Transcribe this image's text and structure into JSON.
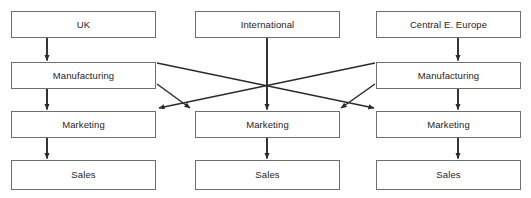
{
  "diagram": {
    "type": "organizational-flow-diagram",
    "orientation": "top-to-bottom",
    "canvas": {
      "width": 531,
      "height": 198
    },
    "style": {
      "box_fill": "#ffffff",
      "box_border": "#6e6e6e",
      "text_color": "#1c1c1c",
      "connector_color": "#2b2b2b",
      "background": "#ffffff"
    },
    "columns": [
      {
        "id": "uk",
        "label": "UK",
        "nodes": [
          {
            "id": "uk-region",
            "label": "UK",
            "x": 11,
            "y": 11,
            "w": 145,
            "h": 27
          },
          {
            "id": "uk-manufacturing",
            "label": "Manufacturing",
            "x": 11,
            "y": 62,
            "w": 145,
            "h": 27
          },
          {
            "id": "uk-marketing",
            "label": "Marketing",
            "x": 11,
            "y": 111,
            "w": 145,
            "h": 27
          },
          {
            "id": "uk-sales",
            "label": "Sales",
            "x": 11,
            "y": 160,
            "w": 145,
            "h": 30
          }
        ]
      },
      {
        "id": "international",
        "label": "International",
        "nodes": [
          {
            "id": "intl-region",
            "label": "International",
            "x": 195,
            "y": 11,
            "w": 145,
            "h": 27
          },
          {
            "id": "intl-marketing",
            "label": "Marketing",
            "x": 195,
            "y": 111,
            "w": 145,
            "h": 27
          },
          {
            "id": "intl-sales",
            "label": "Sales",
            "x": 195,
            "y": 160,
            "w": 145,
            "h": 30
          }
        ]
      },
      {
        "id": "cee",
        "label": "Central E. Europe",
        "nodes": [
          {
            "id": "cee-region",
            "label": "Central E. Europe",
            "x": 376,
            "y": 11,
            "w": 145,
            "h": 27
          },
          {
            "id": "cee-manufacturing",
            "label": "Manufacturing",
            "x": 376,
            "y": 62,
            "w": 145,
            "h": 27
          },
          {
            "id": "cee-marketing",
            "label": "Marketing",
            "x": 376,
            "y": 111,
            "w": 145,
            "h": 27
          },
          {
            "id": "cee-sales",
            "label": "Sales",
            "x": 376,
            "y": 160,
            "w": 145,
            "h": 30
          }
        ]
      }
    ],
    "connectors": [
      {
        "id": "uk-region-to-manufacturing",
        "from": "uk-region",
        "to": "uk-manufacturing",
        "kind": "vertical"
      },
      {
        "id": "uk-manufacturing-to-marketing",
        "from": "uk-manufacturing",
        "to": "uk-marketing",
        "kind": "vertical"
      },
      {
        "id": "uk-marketing-to-sales",
        "from": "uk-marketing",
        "to": "uk-sales",
        "kind": "vertical"
      },
      {
        "id": "intl-region-to-marketing",
        "from": "intl-region",
        "to": "intl-marketing",
        "kind": "vertical-long"
      },
      {
        "id": "intl-marketing-to-sales",
        "from": "intl-marketing",
        "to": "intl-sales",
        "kind": "vertical"
      },
      {
        "id": "cee-region-to-manufacturing",
        "from": "cee-region",
        "to": "cee-manufacturing",
        "kind": "vertical"
      },
      {
        "id": "cee-manufacturing-to-marketing",
        "from": "cee-manufacturing",
        "to": "cee-marketing",
        "kind": "vertical"
      },
      {
        "id": "cee-marketing-to-sales",
        "from": "cee-marketing",
        "to": "cee-sales",
        "kind": "vertical"
      },
      {
        "id": "uk-manufacturing-to-intl-marketing",
        "from": "uk-manufacturing",
        "to": "intl-marketing",
        "kind": "diagonal"
      },
      {
        "id": "uk-manufacturing-to-cee-marketing",
        "from": "uk-manufacturing",
        "to": "cee-marketing",
        "kind": "diagonal"
      },
      {
        "id": "cee-manufacturing-to-intl-marketing",
        "from": "cee-manufacturing",
        "to": "intl-marketing",
        "kind": "diagonal"
      },
      {
        "id": "cee-manufacturing-to-uk-marketing",
        "from": "cee-manufacturing",
        "to": "uk-marketing",
        "kind": "diagonal"
      }
    ]
  }
}
